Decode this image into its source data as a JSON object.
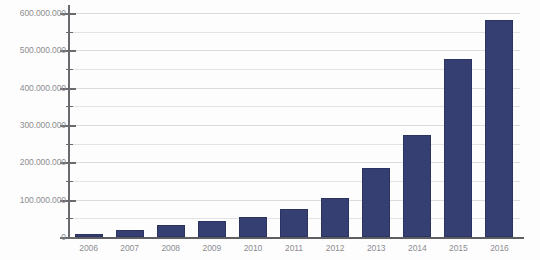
{
  "chart_data": {
    "type": "bar",
    "title": "",
    "subtitle": "",
    "xlabel": "",
    "ylabel": "",
    "categories": [
      "2006",
      "2007",
      "2008",
      "2009",
      "2010",
      "2011",
      "2012",
      "2013",
      "2014",
      "2015",
      "2016"
    ],
    "values": [
      8000000,
      20000000,
      31000000,
      42000000,
      53000000,
      75000000,
      105000000,
      185000000,
      273000000,
      477000000,
      580000000
    ],
    "series": [
      {
        "name": "",
        "values": [
          8000000,
          20000000,
          31000000,
          42000000,
          53000000,
          75000000,
          105000000,
          185000000,
          273000000,
          477000000,
          580000000
        ]
      }
    ],
    "ylim": [
      0,
      600000000
    ],
    "y_major_step": 100000000,
    "y_minor_step": 50000000,
    "y_tick_labels": [
      "0",
      "100.000.000",
      "200.000.000",
      "300.000.000",
      "400.000.000",
      "500.000.000",
      "600.000.000"
    ],
    "y_tick_values": [
      0,
      100000000,
      200000000,
      300000000,
      400000000,
      500000000,
      600000000
    ],
    "y_minor_values": [
      50000000,
      150000000,
      250000000,
      350000000,
      450000000,
      550000000
    ],
    "grid": true,
    "grid_axis": "y",
    "legend": false,
    "legend_position": "none",
    "bar_color": "#353f72",
    "bar_border_color": "#2b3460",
    "grid_color": "#e3e3e6",
    "axis_color": "#6a6a6e",
    "label_color": "#8d8d91",
    "background": "#fdfdfd"
  }
}
